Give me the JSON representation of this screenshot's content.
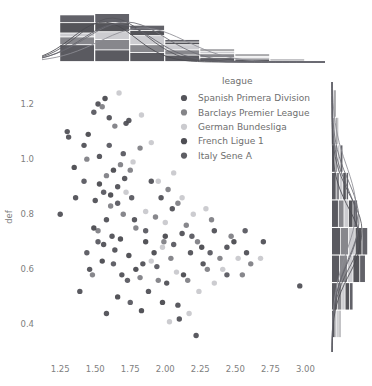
{
  "chart_data": {
    "type": "scatter",
    "title": "",
    "xlabel": "",
    "ylabel": "def",
    "xlim": [
      1.12,
      3.14
    ],
    "ylim": [
      0.3,
      1.28
    ],
    "xticks": [
      "1.25",
      "1.50",
      "1.75",
      "2.00",
      "2.25",
      "2.50",
      "2.75",
      "3.00"
    ],
    "xtick_values": [
      1.25,
      1.5,
      1.75,
      2.0,
      2.25,
      2.5,
      2.75,
      3.0
    ],
    "yticks": [
      "1.2",
      "1.0",
      "0.8",
      "0.6",
      "0.4"
    ],
    "ytick_values": [
      1.2,
      1.0,
      0.8,
      0.6,
      0.4
    ],
    "grid": false,
    "legend_position": "upper-center-right",
    "legend_title": "league",
    "marginal_top": "stacked histogram with kde curves",
    "marginal_right": "stacked horizontal histogram with kde curves",
    "series": [
      {
        "name": "Spanish Primera Division",
        "color": "#4c4c52",
        "points": [
          [
            1.3,
            1.1
          ],
          [
            1.31,
            1.08
          ],
          [
            1.52,
            1.2
          ],
          [
            1.6,
            1.15
          ],
          [
            1.42,
            1.05
          ],
          [
            1.53,
            1.01
          ],
          [
            1.72,
            1.13
          ],
          [
            1.74,
            1.14
          ],
          [
            1.36,
            0.86
          ],
          [
            1.5,
            0.85
          ],
          [
            1.66,
            0.9
          ],
          [
            1.71,
            0.93
          ],
          [
            1.25,
            0.8
          ],
          [
            1.58,
            0.78
          ],
          [
            1.78,
            0.78
          ],
          [
            1.62,
            0.72
          ],
          [
            1.56,
            0.69
          ],
          [
            1.64,
            0.67
          ],
          [
            1.46,
            0.6
          ],
          [
            1.69,
            0.58
          ],
          [
            1.84,
            0.62
          ],
          [
            1.9,
            0.92
          ],
          [
            1.97,
            0.86
          ],
          [
            2.05,
            0.82
          ],
          [
            2.12,
            0.73
          ],
          [
            2.18,
            0.66
          ],
          [
            2.01,
            0.55
          ],
          [
            2.27,
            0.62
          ],
          [
            2.35,
            0.74
          ],
          [
            2.09,
            0.47
          ],
          [
            2.22,
            0.36
          ],
          [
            2.44,
            0.68
          ],
          [
            2.58,
            0.66
          ],
          [
            2.7,
            0.7
          ],
          [
            2.96,
            0.54
          ],
          [
            1.39,
            0.52
          ],
          [
            1.88,
            0.52
          ],
          [
            1.58,
            0.44
          ],
          [
            2.1,
            0.42
          ]
        ]
      },
      {
        "name": "Barclays Premier League",
        "color": "#7d7d82",
        "points": [
          [
            1.55,
            1.19
          ],
          [
            1.64,
            1.12
          ],
          [
            1.44,
            1.0
          ],
          [
            1.68,
            0.98
          ],
          [
            1.75,
            0.96
          ],
          [
            1.58,
            0.94
          ],
          [
            1.82,
            1.04
          ],
          [
            1.61,
            0.83
          ],
          [
            1.7,
            0.8
          ],
          [
            1.79,
            0.75
          ],
          [
            1.52,
            0.74
          ],
          [
            1.93,
            0.79
          ],
          [
            2.02,
            0.89
          ],
          [
            2.09,
            0.84
          ],
          [
            1.99,
            0.7
          ],
          [
            2.15,
            0.76
          ],
          [
            2.23,
            0.7
          ],
          [
            2.33,
            0.78
          ],
          [
            2.47,
            0.72
          ],
          [
            2.3,
            0.6
          ],
          [
            1.82,
            0.57
          ],
          [
            1.95,
            0.56
          ],
          [
            2.16,
            0.56
          ],
          [
            1.48,
            0.58
          ],
          [
            2.55,
            0.58
          ],
          [
            2.61,
            0.62
          ],
          [
            2.04,
            0.64
          ],
          [
            2.39,
            0.64
          ]
        ]
      },
      {
        "name": "German Bundesliga",
        "color": "#c8c8cc",
        "points": [
          [
            1.67,
            1.24
          ],
          [
            1.83,
            1.16
          ],
          [
            1.9,
            1.06
          ],
          [
            1.77,
            0.99
          ],
          [
            1.95,
            0.92
          ],
          [
            1.72,
            0.88
          ],
          [
            2.06,
            0.95
          ],
          [
            1.86,
            0.81
          ],
          [
            2.0,
            0.77
          ],
          [
            2.12,
            0.86
          ],
          [
            1.98,
            0.68
          ],
          [
            2.2,
            0.8
          ],
          [
            2.29,
            0.82
          ],
          [
            2.08,
            0.59
          ],
          [
            2.24,
            0.52
          ],
          [
            2.41,
            0.6
          ],
          [
            2.52,
            0.64
          ],
          [
            1.9,
            0.63
          ],
          [
            2.35,
            0.55
          ],
          [
            2.68,
            0.64
          ],
          [
            2.17,
            0.44
          ],
          [
            2.03,
            0.41
          ]
        ]
      },
      {
        "name": "French Ligue 1",
        "color": "#45454b",
        "points": [
          [
            1.57,
            1.22
          ],
          [
            1.45,
            1.09
          ],
          [
            1.35,
            0.97
          ],
          [
            1.63,
            0.96
          ],
          [
            1.53,
            0.91
          ],
          [
            1.61,
            0.87
          ],
          [
            1.49,
            0.75
          ],
          [
            1.68,
            0.71
          ],
          [
            1.74,
            0.65
          ],
          [
            1.55,
            0.63
          ],
          [
            1.86,
            0.7
          ],
          [
            1.79,
            0.6
          ],
          [
            1.92,
            0.66
          ],
          [
            2.0,
            0.72
          ],
          [
            1.66,
            0.5
          ],
          [
            2.13,
            0.58
          ],
          [
            2.26,
            0.68
          ],
          [
            2.49,
            0.7
          ],
          [
            1.98,
            0.48
          ],
          [
            1.83,
            0.45
          ]
        ]
      },
      {
        "name": "Italy Sene A",
        "color": "#55555c",
        "points": [
          [
            1.49,
            1.17
          ],
          [
            1.6,
            1.05
          ],
          [
            1.7,
            1.02
          ],
          [
            1.42,
            0.92
          ],
          [
            1.56,
            0.88
          ],
          [
            1.66,
            0.84
          ],
          [
            1.76,
            0.86
          ],
          [
            1.52,
            0.7
          ],
          [
            1.63,
            0.62
          ],
          [
            1.73,
            0.56
          ],
          [
            1.86,
            0.74
          ],
          [
            1.94,
            0.61
          ],
          [
            2.06,
            0.69
          ],
          [
            2.19,
            0.72
          ],
          [
            2.32,
            0.66
          ],
          [
            2.44,
            0.58
          ],
          [
            2.57,
            0.74
          ],
          [
            1.44,
            0.66
          ],
          [
            1.75,
            0.48
          ]
        ]
      }
    ],
    "top_hist": {
      "bin_edges": [
        1.25,
        1.5,
        1.75,
        2.0,
        2.25,
        2.5,
        2.75,
        3.0,
        3.14
      ],
      "stacks": [
        {
          "name": "Spanish Primera Division",
          "values": [
            13,
            9,
            7,
            5,
            3,
            2,
            1,
            0
          ]
        },
        {
          "name": "Barclays Premier League",
          "values": [
            6,
            8,
            6,
            4,
            3,
            1,
            1,
            0
          ]
        },
        {
          "name": "German Bundesliga",
          "values": [
            3,
            6,
            7,
            4,
            2,
            1,
            0,
            0
          ]
        },
        {
          "name": "French Ligue 1",
          "values": [
            8,
            7,
            4,
            2,
            1,
            1,
            0,
            0
          ]
        },
        {
          "name": "Italy Sene A",
          "values": [
            6,
            7,
            4,
            2,
            1,
            1,
            0,
            0
          ]
        }
      ]
    },
    "right_hist": {
      "bin_edges": [
        0.35,
        0.45,
        0.55,
        0.65,
        0.75,
        0.85,
        0.95,
        1.05,
        1.15,
        1.25
      ],
      "stacks": [
        {
          "name": "Spanish Primera Division",
          "values": [
            3,
            5,
            7,
            8,
            6,
            4,
            3,
            2,
            1
          ]
        },
        {
          "name": "Barclays Premier League",
          "values": [
            1,
            4,
            7,
            7,
            5,
            3,
            2,
            1,
            0
          ]
        },
        {
          "name": "German Bundesliga",
          "values": [
            2,
            3,
            5,
            6,
            4,
            3,
            2,
            1,
            1
          ]
        },
        {
          "name": "French Ligue 1",
          "values": [
            1,
            4,
            6,
            6,
            4,
            3,
            1,
            1,
            1
          ]
        },
        {
          "name": "Italy Sene A",
          "values": [
            1,
            3,
            5,
            5,
            4,
            2,
            2,
            1,
            1
          ]
        }
      ]
    }
  },
  "legend": {
    "title": "league",
    "items": [
      {
        "label": "Spanish Primera Division",
        "color": "#4c4c52"
      },
      {
        "label": "Barclays Premier League",
        "color": "#7d7d82"
      },
      {
        "label": "German Bundesliga",
        "color": "#c8c8cc"
      },
      {
        "label": "French Ligue 1",
        "color": "#45454b"
      },
      {
        "label": "Italy Sene A",
        "color": "#55555c"
      }
    ]
  },
  "axes": {
    "ylabel": "def",
    "xticklabels": [
      "1.25",
      "1.50",
      "1.75",
      "2.00",
      "2.25",
      "2.50",
      "2.75",
      "3.00"
    ],
    "yticklabels": [
      "1.2",
      "1.0",
      "0.8",
      "0.6",
      "0.4"
    ]
  }
}
